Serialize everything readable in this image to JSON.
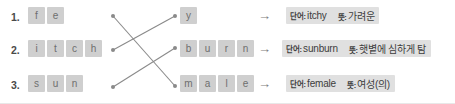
{
  "worksheet": {
    "type": "word-matching-exercise",
    "colors": {
      "tile_bg": "#cfcfcf",
      "tile_text": "#6e6e6e",
      "strip_bg": "#e0e0e0",
      "line": "#8a8a8a",
      "page_bg": "#ffffff"
    },
    "arrow_glyph": "→",
    "rows": [
      {
        "number": "1.",
        "left_tiles": [
          "f",
          "e"
        ],
        "right_tiles": [
          "y"
        ],
        "word_label": "단어:",
        "word_value": "itchy",
        "meaning_label": "뜻:",
        "meaning_value": "가려운"
      },
      {
        "number": "2.",
        "left_tiles": [
          "i",
          "t",
          "c",
          "h"
        ],
        "right_tiles": [
          "b",
          "u",
          "r",
          "n"
        ],
        "word_label": "단어:",
        "word_value": "sunburn",
        "meaning_label": "뜻:",
        "meaning_value": "햇볕에 심하게 탐"
      },
      {
        "number": "3.",
        "left_tiles": [
          "s",
          "u",
          "n"
        ],
        "right_tiles": [
          "m",
          "a",
          "l",
          "e"
        ],
        "word_label": "단어:",
        "word_value": "female",
        "meaning_label": "뜻:",
        "meaning_value": "여성(의)"
      }
    ],
    "connections": [
      {
        "from_row": 1,
        "to_row": 3,
        "x1": 113,
        "y1": 16,
        "x2": 175,
        "y2": 86
      },
      {
        "from_row": 2,
        "to_row": 1,
        "x1": 113,
        "y1": 50,
        "x2": 175,
        "y2": 16
      },
      {
        "from_row": 3,
        "to_row": 2,
        "x1": 113,
        "y1": 87,
        "x2": 175,
        "y2": 48
      }
    ]
  }
}
